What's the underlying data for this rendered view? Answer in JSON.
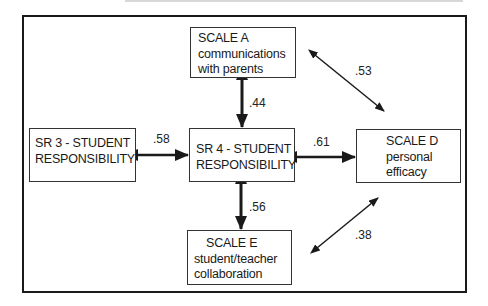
{
  "diagram": {
    "type": "correlation-path-diagram",
    "nodes": {
      "scale_a": {
        "lines": [
          "SCALE A",
          "communications",
          "with parents"
        ]
      },
      "sr3": {
        "lines": [
          "SR 3 - STUDENT",
          "RESPONSIBILITY"
        ]
      },
      "sr4": {
        "lines": [
          "SR 4 - STUDENT",
          "RESPONSIBILITY"
        ]
      },
      "scale_d": {
        "lines": [
          "SCALE D",
          "personal",
          "efficacy"
        ]
      },
      "scale_e": {
        "lines": [
          "SCALE E",
          "student/teacher",
          "collaboration"
        ]
      }
    },
    "edges": [
      {
        "from": "scale_a",
        "to": "sr4",
        "label": ".44"
      },
      {
        "from": "sr3",
        "to": "sr4",
        "label": ".58"
      },
      {
        "from": "sr4",
        "to": "scale_d",
        "label": ".61"
      },
      {
        "from": "sr4",
        "to": "scale_e",
        "label": ".56"
      },
      {
        "from": "scale_a",
        "to": "scale_d",
        "label": ".53"
      },
      {
        "from": "scale_e",
        "to": "scale_d",
        "label": ".38"
      }
    ],
    "colors": {
      "line": "#1a1a1a",
      "background": "#ffffff"
    }
  }
}
